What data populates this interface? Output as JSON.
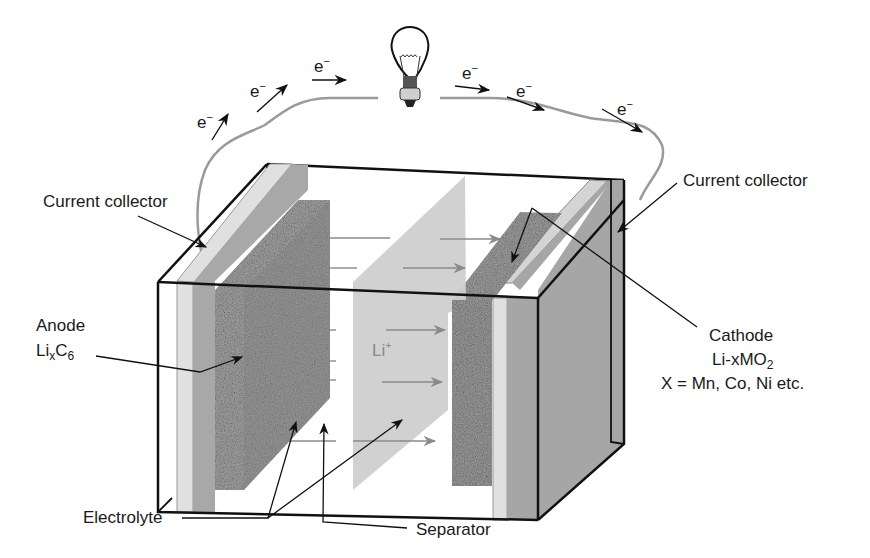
{
  "diagram": {
    "electron_label": "e",
    "electron_sup": "−",
    "labels": {
      "current_collector_left": "Current collector",
      "current_collector_right": "Current collector",
      "anode": "Anode",
      "anode_formula_main": "Li",
      "anode_formula_sub_x": "x",
      "anode_formula_c": "C",
      "anode_formula_sub_6": "6",
      "cathode": "Cathode",
      "cathode_formula_main": "Li-xMO",
      "cathode_formula_sub": "2",
      "cathode_note": "X = Mn, Co, Ni etc.",
      "electrolyte": "Electrolyte",
      "separator": "Separator",
      "li_ion_main": "Li",
      "li_ion_sup": "+"
    },
    "components": [
      "light-bulb",
      "wire",
      "anode-current-collector",
      "anode",
      "electrolyte",
      "separator",
      "cathode",
      "cathode-current-collector",
      "cell-case"
    ],
    "colors": {
      "outline": "#111111",
      "wire": "#9a9a9a",
      "collector": "#d4d4d4",
      "collector_back": "#ababab",
      "anode": "#9a9a9a",
      "separator": "#cfcfcf",
      "cathode": "#9c9c9c",
      "arrow_gray": "#8a8a8a"
    }
  }
}
